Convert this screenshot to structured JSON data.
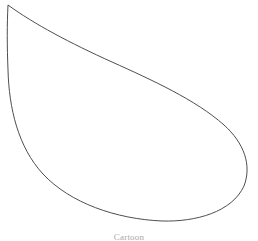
{
  "figure": {
    "caption": "Cartoon",
    "background_color": "#ffffff",
    "stroke_color": "#3a3a3a",
    "fill_color": "none",
    "stroke_width": 0.9,
    "canvas": {
      "width": 258,
      "height": 241
    },
    "shape": {
      "name": "leaf-outline",
      "description": "Closed teardrop / leaf silhouette with a single sharp cusp at the upper-left and a broad rounded lobe at the lower-right",
      "cusp_point": {
        "x": 8,
        "y": 5
      },
      "extremes": {
        "leftmost": {
          "x": 7,
          "y": 110
        },
        "rightmost": {
          "x": 250,
          "y": 157
        },
        "topmost": {
          "x": 8,
          "y": 5
        },
        "bottommost": {
          "x": 166,
          "y": 221
        }
      },
      "path": "M 8 5 C 34 24 70 43 112 62 C 152 80 196 100 224 125 C 244 143 252 165 244 186 C 232 212 196 222 162 221 C 116 219 70 203 43 174 C 18 147 9 108 8 70 C 7 46 7 24 8 5 Z"
    }
  }
}
